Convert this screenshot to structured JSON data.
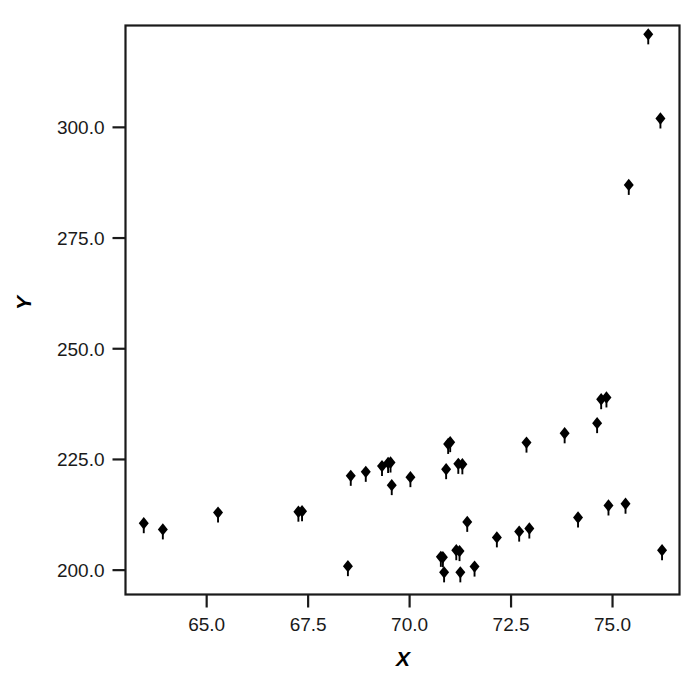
{
  "chart_data": {
    "type": "scatter",
    "title": "",
    "xlabel": "X",
    "ylabel": "Y",
    "xlim": [
      63.0,
      76.65
    ],
    "ylim": [
      194.5,
      323.0
    ],
    "grid": false,
    "legend": null,
    "marker": "filled-diamond",
    "marker_color": "#000000",
    "xticks": [
      65.0,
      67.5,
      70.0,
      72.5,
      75.0
    ],
    "xtick_labels": [
      "65.0",
      "67.5",
      "70.0",
      "72.5",
      "75.0"
    ],
    "yticks": [
      200.0,
      225.0,
      250.0,
      275.0,
      300.0
    ],
    "ytick_labels": [
      "200.0",
      "225.0",
      "250.0",
      "275.0",
      "300.0"
    ],
    "points": [
      {
        "x": 63.45,
        "y": 210.6
      },
      {
        "x": 63.92,
        "y": 209.2
      },
      {
        "x": 65.28,
        "y": 213.0
      },
      {
        "x": 67.26,
        "y": 213.2
      },
      {
        "x": 67.35,
        "y": 213.3
      },
      {
        "x": 68.48,
        "y": 200.9
      },
      {
        "x": 68.55,
        "y": 221.3
      },
      {
        "x": 68.92,
        "y": 222.2
      },
      {
        "x": 69.32,
        "y": 223.5
      },
      {
        "x": 69.47,
        "y": 224.2
      },
      {
        "x": 69.53,
        "y": 224.3
      },
      {
        "x": 69.56,
        "y": 219.2
      },
      {
        "x": 70.02,
        "y": 221.0
      },
      {
        "x": 70.77,
        "y": 203.0
      },
      {
        "x": 70.82,
        "y": 202.9
      },
      {
        "x": 70.85,
        "y": 199.5
      },
      {
        "x": 70.9,
        "y": 222.8
      },
      {
        "x": 70.95,
        "y": 228.5
      },
      {
        "x": 71.0,
        "y": 228.9
      },
      {
        "x": 71.15,
        "y": 204.5
      },
      {
        "x": 71.2,
        "y": 224.0
      },
      {
        "x": 71.23,
        "y": 204.3
      },
      {
        "x": 71.25,
        "y": 199.5
      },
      {
        "x": 71.3,
        "y": 223.9
      },
      {
        "x": 71.42,
        "y": 210.9
      },
      {
        "x": 71.6,
        "y": 200.8
      },
      {
        "x": 72.15,
        "y": 207.4
      },
      {
        "x": 72.7,
        "y": 208.7
      },
      {
        "x": 72.88,
        "y": 228.8
      },
      {
        "x": 72.95,
        "y": 209.4
      },
      {
        "x": 73.82,
        "y": 230.9
      },
      {
        "x": 74.15,
        "y": 211.9
      },
      {
        "x": 74.62,
        "y": 233.2
      },
      {
        "x": 74.72,
        "y": 238.6
      },
      {
        "x": 74.85,
        "y": 239.0
      },
      {
        "x": 74.9,
        "y": 214.6
      },
      {
        "x": 75.32,
        "y": 215.0
      },
      {
        "x": 75.4,
        "y": 287.0
      },
      {
        "x": 75.88,
        "y": 321.0
      },
      {
        "x": 76.18,
        "y": 302.0
      },
      {
        "x": 76.22,
        "y": 204.5
      }
    ]
  },
  "axes": {
    "x_title": "X",
    "y_title": "Y"
  }
}
